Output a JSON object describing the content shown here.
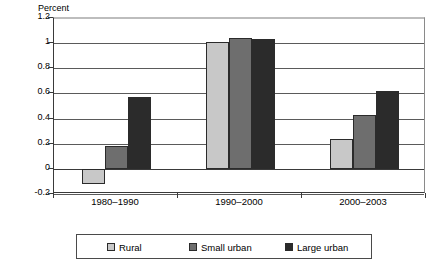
{
  "chart_data": {
    "type": "bar",
    "title": "",
    "subtitle": "",
    "xlabel": "",
    "ylabel": "Percent",
    "categories": [
      "1980–1990",
      "1990–2000",
      "2000–2003"
    ],
    "series": [
      {
        "name": "Rural",
        "color": "#c8c8c8",
        "values": [
          -0.12,
          1.01,
          0.24
        ]
      },
      {
        "name": "Small urban",
        "color": "#6e6e6e",
        "values": [
          0.18,
          1.04,
          0.43
        ]
      },
      {
        "name": "Large urban",
        "color": "#2b2b2b",
        "values": [
          0.57,
          1.03,
          0.62
        ]
      }
    ],
    "ylim": [
      -0.2,
      1.2
    ],
    "yticks": [
      1.2,
      1,
      0.8,
      0.6,
      0.4,
      0.2,
      0,
      -0.2
    ],
    "ytick_labels": [
      "1.2",
      "1",
      "0.8",
      "0.6",
      "0.4",
      "0.2",
      "0",
      "-0.2"
    ],
    "grid": "horizontal",
    "legend_position": "bottom",
    "legend_border": true,
    "grouped": true
  }
}
